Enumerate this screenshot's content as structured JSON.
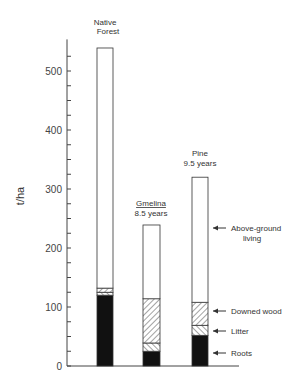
{
  "chart_data": {
    "type": "bar",
    "stacked": true,
    "title": "",
    "xlabel": "",
    "ylabel": "t/ha",
    "ylim": [
      0,
      540
    ],
    "yticks": [
      0,
      100,
      200,
      300,
      400,
      500
    ],
    "minor_tick_step": 25,
    "grid": false,
    "categories": [
      "Native Forest",
      "Gmelina 8.5 years",
      "Pine 9.5 years"
    ],
    "category_labels": [
      {
        "line1": "Native",
        "line2": "Forest",
        "underline": false
      },
      {
        "line1": "Gmelina",
        "line2": "8.5 years",
        "underline": true
      },
      {
        "line1": "Pine",
        "line2": "9.5 years",
        "underline": false
      }
    ],
    "series": [
      {
        "name": "Roots",
        "pattern": "solid-black",
        "values": [
          120,
          25,
          52
        ]
      },
      {
        "name": "Litter",
        "pattern": "light-hatch",
        "values": [
          5,
          14,
          17
        ]
      },
      {
        "name": "Downed wood",
        "pattern": "dense-hatch",
        "values": [
          7,
          75,
          39
        ]
      },
      {
        "name": "Above-ground living",
        "pattern": "white",
        "values": [
          407,
          125,
          212
        ]
      }
    ],
    "totals": [
      539,
      239,
      320
    ],
    "legend": {
      "position": "right-of-pine-bar-with-arrows",
      "entries": [
        {
          "label_line1": "Above-ground",
          "label_line2": "living"
        },
        {
          "label_line1": "Downed wood"
        },
        {
          "label_line1": "Litter"
        },
        {
          "label_line1": "Roots"
        }
      ]
    }
  }
}
